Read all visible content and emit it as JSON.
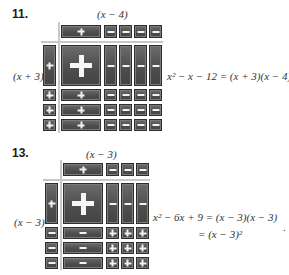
{
  "problems": [
    {
      "number": "11.",
      "top_label": "(x − 4)",
      "side_label": "(x + 3)",
      "top_row": [
        "+",
        "−",
        "−",
        "−",
        "−"
      ],
      "left_col": [
        "+",
        "+",
        "+",
        "+"
      ],
      "grid": [
        [
          "+",
          "−",
          "−",
          "−",
          "−"
        ],
        [
          "+",
          "−",
          "−",
          "−",
          "−"
        ],
        [
          "+",
          "−",
          "−",
          "−",
          "−"
        ],
        [
          "+",
          "−",
          "−",
          "−",
          "−"
        ]
      ],
      "equation": [
        "x² − x − 12 = (x + 3)(x − 4)"
      ]
    },
    {
      "number": "13.",
      "top_label": "(x − 3)",
      "side_label": "(x − 3)",
      "top_row": [
        "+",
        "−",
        "−",
        "−"
      ],
      "left_col": [
        "+",
        "−",
        "−",
        "−"
      ],
      "grid": [
        [
          "+",
          "−",
          "−",
          "−"
        ],
        [
          "−",
          "+",
          "+",
          "+"
        ],
        [
          "−",
          "+",
          "+",
          "+"
        ],
        [
          "−",
          "+",
          "+",
          "+"
        ]
      ],
      "equation": [
        "x² − 6x + 9 = (x − 3)(x − 3)",
        "= (x − 3)²"
      ]
    }
  ],
  "trailing_mark": "."
}
